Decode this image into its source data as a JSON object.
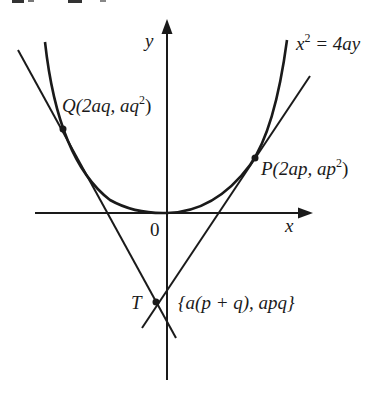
{
  "diagram": {
    "type": "parabola-tangents",
    "curve": {
      "equation": "x^2 = 4ay",
      "label_lhs": "x",
      "label_exp": "2",
      "label_rhs": " = 4ay"
    },
    "axes": {
      "x_label": "x",
      "y_label": "y",
      "origin_label": "0"
    },
    "points": {
      "P": {
        "name": "P",
        "coords_open": "(2ap, ap",
        "coords_exp": "2",
        "coords_close": ")"
      },
      "Q": {
        "name": "Q",
        "coords_open": "(2aq, aq",
        "coords_exp": "2",
        "coords_close": ")"
      },
      "T": {
        "name": "T",
        "coords": "{a(p + q), apq}"
      }
    },
    "colors": {
      "ink": "#1a1a1a",
      "background": "#ffffff"
    }
  }
}
